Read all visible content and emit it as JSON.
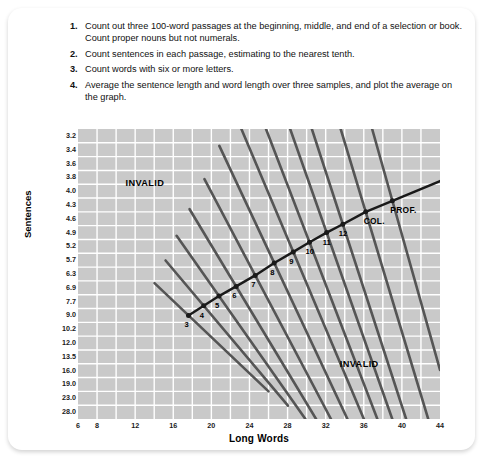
{
  "instructions": [
    {
      "num": "1.",
      "text": "Count out three 100-word passages at the beginning, middle, and end of a selection or book. Count proper nouns but not numerals."
    },
    {
      "num": "2.",
      "text": "Count sentences in each passage, estimating to the nearest tenth."
    },
    {
      "num": "3.",
      "text": "Count words with six or more letters."
    },
    {
      "num": "4.",
      "text": "Average the sentence length and word length over three samples, and plot the average on the graph."
    }
  ],
  "chart_data": {
    "type": "line",
    "title": "",
    "xlabel": "Long Words",
    "ylabel": "Sentences",
    "xlim": [
      6,
      44
    ],
    "ylim": [
      0,
      20
    ],
    "grid": true,
    "legend_position": "none",
    "x_ticks": [
      6,
      8,
      12,
      16,
      20,
      24,
      28,
      32,
      36,
      40,
      44
    ],
    "x_tick_labels": [
      "6",
      "8",
      "12",
      "16",
      "20",
      "24",
      "28",
      "32",
      "36",
      "40",
      "44"
    ],
    "y_tick_labels": [
      "3.2",
      "3.4",
      "3.6",
      "3.8",
      "4.0",
      "4.3",
      "4.6",
      "4.9",
      "5.2",
      "5.7",
      "6.3",
      "6.9",
      "7.7",
      "9.0",
      "10.2",
      "12.0",
      "13.5",
      "16.0",
      "19.0",
      "23.0",
      "28.0"
    ],
    "annotations": [
      {
        "text": "INVALID",
        "x": 13.5,
        "y_row": 3.4
      },
      {
        "text": "INVALID",
        "x": 36.0,
        "y_row": 16.5
      }
    ],
    "curve_points": [
      {
        "label": "3",
        "x": 17.6,
        "row": 13.0
      },
      {
        "label": "4",
        "x": 19.2,
        "row": 12.3
      },
      {
        "label": "5",
        "x": 20.8,
        "row": 11.6
      },
      {
        "label": "6",
        "x": 22.6,
        "row": 10.9
      },
      {
        "label": "7",
        "x": 24.6,
        "row": 10.1
      },
      {
        "label": "8",
        "x": 26.6,
        "row": 9.2
      },
      {
        "label": "9",
        "x": 28.6,
        "row": 8.4
      },
      {
        "label": "10",
        "x": 30.3,
        "row": 7.7
      },
      {
        "label": "11",
        "x": 32.1,
        "row": 7.0
      },
      {
        "label": "12",
        "x": 33.8,
        "row": 6.4
      },
      {
        "label": "COL.",
        "x": 36.2,
        "row": 5.5
      },
      {
        "label": "PROF.",
        "x": 39.0,
        "row": 4.7
      }
    ],
    "colors": {
      "plot_background": "#c9c9c9",
      "grid_line": "#ffffff",
      "grade_line": "#555555",
      "curve": "#1a1a1a",
      "text": "#111111"
    }
  }
}
